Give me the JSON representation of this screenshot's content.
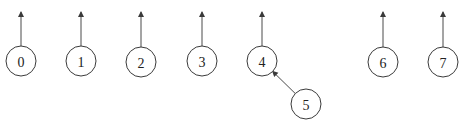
{
  "diagram": {
    "type": "disjoint-set-forest",
    "colors": {
      "stroke": "#3a3a3a",
      "edge": "#4a4a4a",
      "background": "#ffffff",
      "text": "#222222"
    },
    "radius": 15,
    "nodes": [
      {
        "id": "0",
        "label": "0",
        "x": 21,
        "y": 61,
        "root": true
      },
      {
        "id": "1",
        "label": "1",
        "x": 81,
        "y": 61,
        "root": true
      },
      {
        "id": "2",
        "label": "2",
        "x": 141,
        "y": 62,
        "root": true
      },
      {
        "id": "3",
        "label": "3",
        "x": 202,
        "y": 61,
        "root": true
      },
      {
        "id": "4",
        "label": "4",
        "x": 262,
        "y": 61,
        "root": true
      },
      {
        "id": "5",
        "label": "5",
        "x": 306,
        "y": 104,
        "root": false,
        "parent": "4"
      },
      {
        "id": "6",
        "label": "6",
        "x": 383,
        "y": 62,
        "root": true
      },
      {
        "id": "7",
        "label": "7",
        "x": 443,
        "y": 62,
        "root": true
      }
    ],
    "edges": [
      {
        "from": "5",
        "to": "4"
      }
    ]
  }
}
